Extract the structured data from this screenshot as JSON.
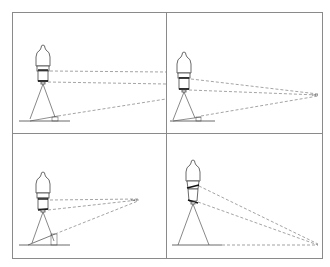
{
  "figure": {
    "title": "",
    "panels": [
      {
        "id": "top-left",
        "description": "Camera on tripod, level; dashed sight lines diverge to the right edge; wedge-shaped tilt marker on ground"
      },
      {
        "id": "top-right",
        "description": "Camera on tripod; dashed sight lines converge to a vanishing point at right; small wedge on ground"
      },
      {
        "id": "bottom-left",
        "description": "Camera on tripod; dashed lines converge to point near center-right; raised wedge/step on ground"
      },
      {
        "id": "bottom-right",
        "description": "Camera tilted lens rings; dashed lines converge to point at lower right on ground line"
      }
    ]
  },
  "colors": {
    "frame": "#8a8a8a",
    "line": "#555555",
    "thick": "#111111",
    "background": "#ffffff"
  }
}
